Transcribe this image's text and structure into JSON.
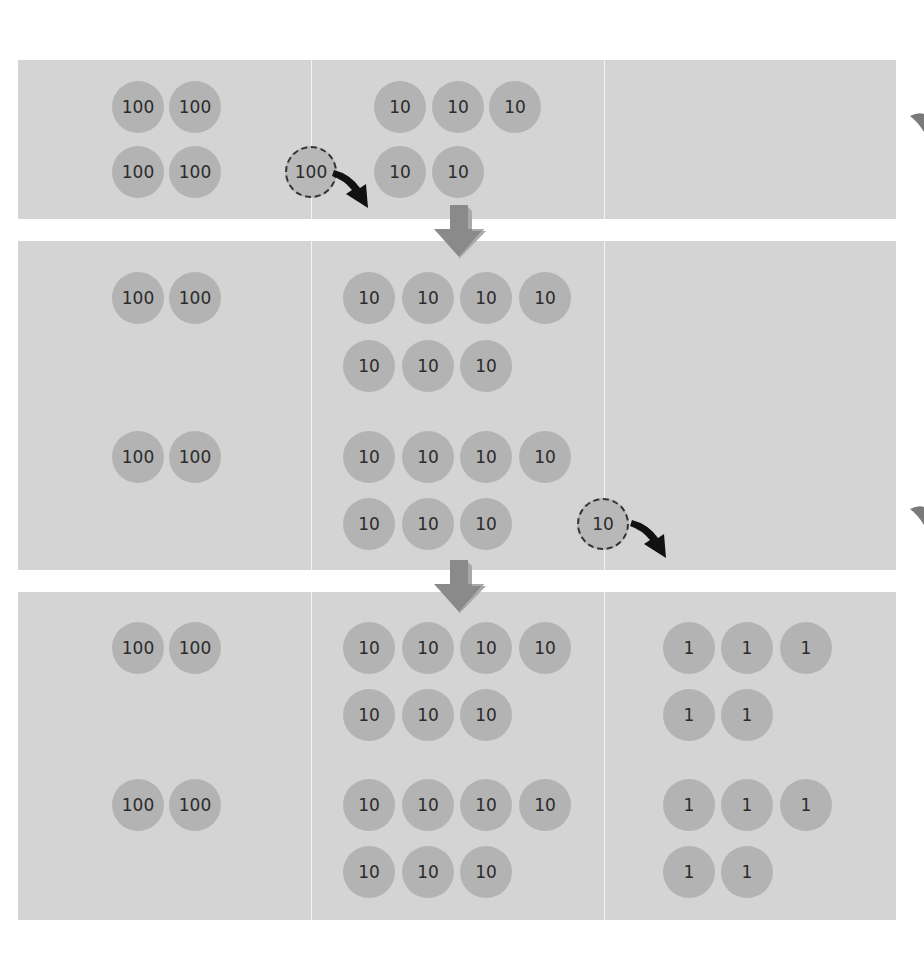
{
  "colors": {
    "panel_bg": "#d4d4d4",
    "disc_fill": "#b3b3b3",
    "disc_text": "#2b2b2b",
    "down_arrow": "#8f8f8f",
    "regroup_arrow": "#111111"
  },
  "columns": [
    "hundreds",
    "tens",
    "ones"
  ],
  "steps": [
    {
      "id": "step-1",
      "hundreds": [
        "100",
        "100",
        "100",
        "100"
      ],
      "tens": [
        "10",
        "10",
        "10",
        "10",
        "10"
      ],
      "ones": [],
      "regroup_disc": "100"
    },
    {
      "id": "step-2",
      "hundreds": [
        "100",
        "100",
        "100",
        "100"
      ],
      "tens": [
        "10",
        "10",
        "10",
        "10",
        "10",
        "10",
        "10",
        "10",
        "10",
        "10",
        "10",
        "10",
        "10",
        "10"
      ],
      "ones": [],
      "regroup_disc": "10"
    },
    {
      "id": "step-3",
      "hundreds": [
        "100",
        "100",
        "100",
        "100"
      ],
      "tens": [
        "10",
        "10",
        "10",
        "10",
        "10",
        "10",
        "10",
        "10",
        "10",
        "10",
        "10",
        "10",
        "10",
        "10"
      ],
      "ones": [
        "1",
        "1",
        "1",
        "1",
        "1",
        "1",
        "1",
        "1",
        "1",
        "1"
      ]
    }
  ]
}
